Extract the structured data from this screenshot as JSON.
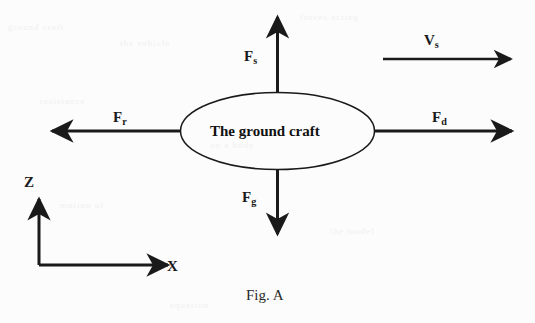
{
  "figure": {
    "caption": "Fig. A",
    "body_label": "The ground craft",
    "stroke_color": "#1a1a1a",
    "background_color": "#fcfcfc"
  },
  "forces": [
    {
      "id": "lift",
      "name": "F_s",
      "base": "F",
      "sub": "s",
      "direction": "up",
      "label_x": 244,
      "label_y": 49
    },
    {
      "id": "drag",
      "name": "F_d",
      "base": "F",
      "sub": "d",
      "direction": "right",
      "label_x": 432,
      "label_y": 110
    },
    {
      "id": "thrust",
      "name": "F_r",
      "base": "F",
      "sub": "r",
      "direction": "left",
      "label_x": 113,
      "label_y": 110
    },
    {
      "id": "weight",
      "name": "F_g",
      "base": "F",
      "sub": "g",
      "direction": "down",
      "label_x": 242,
      "label_y": 190
    }
  ],
  "velocity": {
    "name": "V_s",
    "base": "V",
    "sub": "s",
    "direction": "right",
    "label_x": 424,
    "label_y": 33
  },
  "axes": [
    {
      "id": "z-axis",
      "label": "Z",
      "direction": "up",
      "label_x": 24,
      "label_y": 175
    },
    {
      "id": "x-axis",
      "label": "X",
      "direction": "right",
      "label_x": 167,
      "label_y": 259
    }
  ],
  "ghost_marks": [
    {
      "text": "ground craft",
      "x": 8,
      "y": 22
    },
    {
      "text": "the vehicle",
      "x": 120,
      "y": 38
    },
    {
      "text": "forces acting",
      "x": 300,
      "y": 12
    },
    {
      "text": "resistance",
      "x": 40,
      "y": 96
    },
    {
      "text": "on a body",
      "x": 210,
      "y": 140
    },
    {
      "text": "motion of",
      "x": 60,
      "y": 200
    },
    {
      "text": "the model",
      "x": 330,
      "y": 226
    },
    {
      "text": "equation",
      "x": 170,
      "y": 300
    }
  ]
}
